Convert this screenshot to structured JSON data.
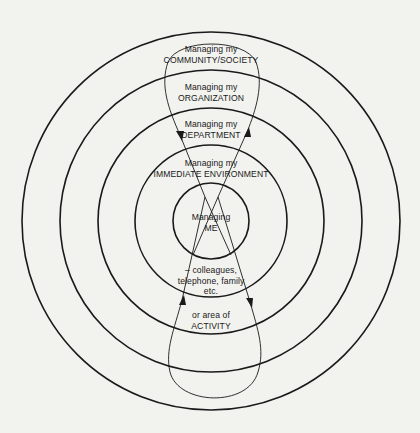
{
  "diagram": {
    "type": "concentric-circles",
    "center": [
      211,
      221
    ],
    "ring_radii": [
      38,
      76,
      113,
      151,
      189
    ],
    "colors": {
      "background": "#f2f2ef",
      "stroke": "#1a1a1a"
    },
    "rings": [
      {
        "level": 1,
        "line1": "Managing",
        "line2": "ME"
      },
      {
        "level": 2,
        "line1": "Managing my",
        "line2": "IMMEDIATE ENVIRONMENT"
      },
      {
        "level": 3,
        "line1": "Managing my",
        "line2": "DEPARTMENT"
      },
      {
        "level": 4,
        "line1": "Managing my",
        "line2": "ORGANIZATION"
      },
      {
        "level": 5,
        "line1": "Managing my",
        "line2": "COMMUNITY/SOCIETY"
      }
    ],
    "notes": [
      {
        "line1": "– colleagues,",
        "line2": "telephone, family",
        "line3": "etc."
      },
      {
        "line1": "or area of",
        "line2": "ACTIVITY"
      }
    ],
    "flows": [
      {
        "name": "upper-loop",
        "direction": "outward on left, inward on right"
      },
      {
        "name": "lower-loop",
        "direction": "outward on right, inward on left"
      }
    ]
  }
}
